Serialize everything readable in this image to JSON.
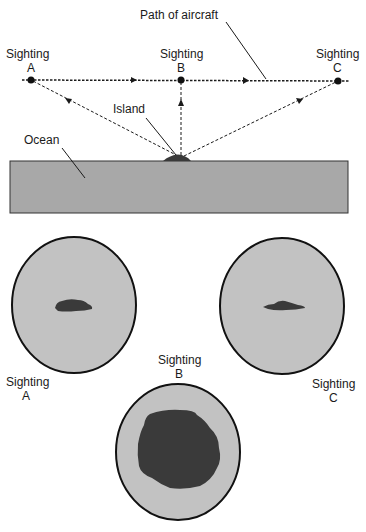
{
  "figure": {
    "path_label": "Path of aircraft",
    "island_label": "Island",
    "ocean_label": "Ocean",
    "sightings": [
      {
        "id": "A",
        "title": "Sighting",
        "letter": "A",
        "view_label_title": "Sighting",
        "view_label_letter": "A"
      },
      {
        "id": "B",
        "title": "Sighting",
        "letter": "B",
        "view_label_title": "Sighting",
        "view_label_letter": "B"
      },
      {
        "id": "C",
        "title": "Sighting",
        "letter": "C",
        "view_label_title": "Sighting",
        "view_label_letter": "C"
      }
    ]
  },
  "colors": {
    "ocean": "#a8a8a8",
    "view_fill": "#c2c2c2",
    "island": "#3a3a3a",
    "line": "#1a1a1a"
  }
}
